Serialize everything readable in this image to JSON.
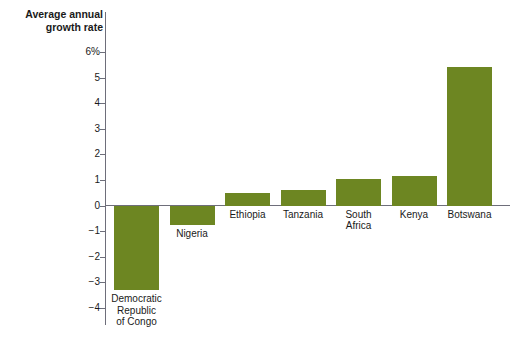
{
  "chart_data": {
    "type": "bar",
    "title": "Average annual\ngrowth rate",
    "xlabel": "",
    "ylabel": "",
    "ylim": [
      -4,
      6
    ],
    "ytick_values": [
      6,
      5,
      4,
      3,
      2,
      1,
      0,
      -1,
      -2,
      -3,
      -4
    ],
    "ytick_labels": [
      "6%",
      "5",
      "4",
      "3",
      "2",
      "1",
      "0",
      "−1",
      "−2",
      "−3",
      "−4"
    ],
    "grid": false,
    "legend": false,
    "bar_color": "#6d8622",
    "axis_color": "#6e6e7a",
    "categories": [
      "Democratic\nRepublic\nof Congo",
      "Nigeria",
      "Ethiopia",
      "Tanzania",
      "South\nAfrica",
      "Kenya",
      "Botswana"
    ],
    "values": [
      -3.3,
      -0.75,
      0.5,
      0.6,
      1.05,
      1.15,
      5.4
    ]
  }
}
